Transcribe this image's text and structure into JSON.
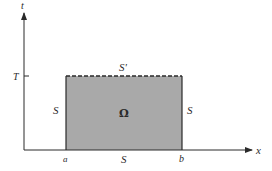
{
  "diagram": {
    "axes": {
      "x_label": "x",
      "y_label": "t",
      "t_tick_label": "T",
      "x_tick_labels": [
        "a",
        "b"
      ]
    },
    "region": {
      "label": "Ω",
      "fill_color": "#a9a9a9",
      "boundaries": {
        "top": "S'",
        "left": "S",
        "right": "S",
        "bottom": "S"
      },
      "top_style": "dashed"
    }
  }
}
